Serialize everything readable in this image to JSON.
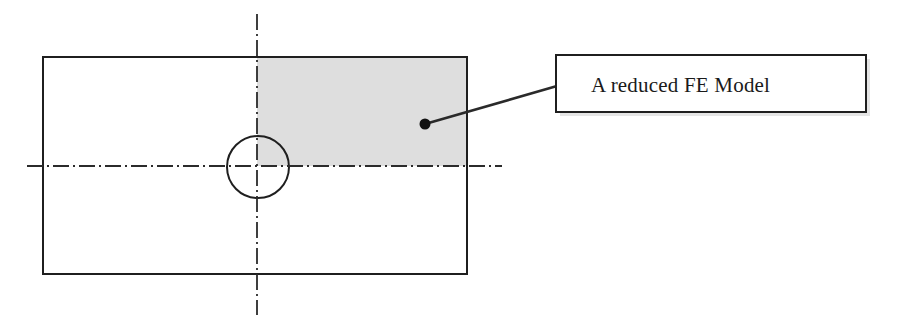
{
  "figure": {
    "type": "engineering-drawing",
    "background_color": "#ffffff"
  },
  "plate": {
    "name": "plate-outline",
    "x": 43,
    "y": 57,
    "width": 424,
    "height": 217,
    "stroke_color": "#1f1f1f",
    "stroke_width": 2,
    "fill": "none"
  },
  "reduced_region": {
    "name": "reduced-fe-model-region",
    "x": 257,
    "y": 58,
    "width": 210,
    "height": 108,
    "fill_color": "#dedede",
    "quadrant": "upper-right"
  },
  "hole": {
    "name": "center-hole",
    "cx": 258,
    "cy": 167,
    "r": 31,
    "stroke_color": "#1f1f1f",
    "stroke_width": 2,
    "fill": "none"
  },
  "centerlines": {
    "stroke_color": "#2b2b2b",
    "stroke_width": 1.8,
    "dash_pattern": "16 4 2 4",
    "horizontal": {
      "name": "horizontal-centerline",
      "x1": 27,
      "y1": 166,
      "x2": 502,
      "y2": 166
    },
    "vertical": {
      "name": "vertical-centerline",
      "x1": 257,
      "y1": 14,
      "x2": 257,
      "y2": 315
    }
  },
  "annotation": {
    "marker": {
      "name": "annotation-dot",
      "cx": 425,
      "cy": 124,
      "r": 5.5,
      "fill_color": "#121212"
    },
    "leader_line": {
      "name": "annotation-leader-line",
      "x1": 425,
      "y1": 124,
      "x2": 557,
      "y2": 86,
      "stroke_color": "#2a2a2a",
      "stroke_width": 2.6
    },
    "callout": {
      "name": "annotation-callout-box",
      "label": "A reduced FE Model",
      "x": 556,
      "y": 55,
      "width": 310,
      "height": 57,
      "stroke_color": "#1f1f1f",
      "stroke_width": 2,
      "fill_color": "#ffffff",
      "text_x": 591,
      "text_baseline": 92,
      "shadow_color": "#cfcfcf"
    }
  }
}
